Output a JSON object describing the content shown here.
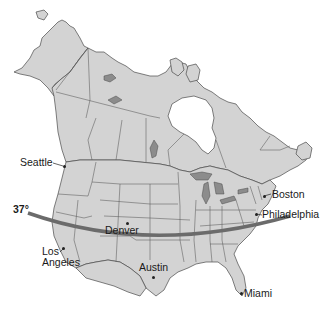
{
  "map": {
    "title": "North America with 37° latitude line",
    "colors": {
      "land": "#d3d3d3",
      "borders": "#4a4a4a",
      "lakes": "#8c8c8c",
      "latitude_line": "#6b6b6b",
      "background": "#ffffff"
    },
    "latitude_line": {
      "label": "37°"
    },
    "cities": [
      {
        "name": "Seattle"
      },
      {
        "name": "Boston"
      },
      {
        "name": "Philadelphia"
      },
      {
        "name": "Denver"
      },
      {
        "name": "Los Angeles",
        "line1": "Los",
        "line2": "Angeles"
      },
      {
        "name": "Austin"
      },
      {
        "name": "Miami"
      }
    ]
  }
}
